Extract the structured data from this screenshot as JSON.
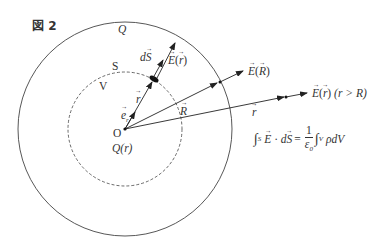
{
  "figure": {
    "title": "図 2",
    "geometry": {
      "origin": {
        "x": 125,
        "y": 129
      },
      "outer_radius": 107,
      "inner_dashed_radius": 57
    },
    "colors": {
      "line": "#333333",
      "background": "#ffffff"
    },
    "labels": {
      "outer_charge": "Q",
      "surface": "S",
      "volume": "V",
      "unit_vector": "e",
      "unit_vector_sub": "r",
      "r_vector": "r",
      "dS": "dS",
      "d_prefix": "d",
      "E_of_r": "E(r)",
      "E_letter": "E",
      "R_vector": "R",
      "E_of_R": "E(R)",
      "r_vector_outside": "r",
      "E_outside": "E(r) (r > R)",
      "E_outside_cond": "(r > R)",
      "origin": "O",
      "enclosed_charge": "Q(r)"
    },
    "formula": {
      "text": "∫S E · dS = (1/ε0) ∫V ρ dV",
      "integral": "∫",
      "lhs_sub": "S",
      "E": "E",
      "dot": "·",
      "dS_d": "d",
      "dS_S": "S",
      "eq": "=",
      "num": "1",
      "den": "ε",
      "den_sub": "0",
      "rhs_sub": "V",
      "rhs": "ρdV"
    }
  }
}
